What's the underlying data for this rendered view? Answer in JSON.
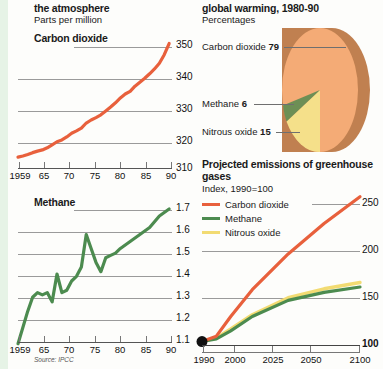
{
  "page": {
    "background": "#fdfdfb",
    "accent_strip_color": "#e6f3e6",
    "source_note": "Source: IPCC"
  },
  "left_column": {
    "heading": "the atmosphere",
    "subheading": "Parts per million",
    "co2_chart_title": "Carbon dioxide",
    "methane_chart_title": "Methane"
  },
  "right_column": {
    "heading": "global warming, 1980-90",
    "subheading": "Percentages",
    "projection_title_line1": "Projected emissions of greenhouse",
    "projection_title_line2": "gases",
    "projection_subtitle": "Index, 1990=100"
  },
  "colors": {
    "carbon_dioxide": "#e8603c",
    "methane": "#4c8b4f",
    "nitrous_oxide": "#f2db72",
    "pie_carbon_dioxide": "#f4ab76",
    "pie_carbon_dioxide_side": "#c08050",
    "pie_methane": "#6d8f55",
    "pie_nitrous_oxide": "#f5e08a",
    "gridline": "#9a9a9a"
  },
  "chart_data": [
    {
      "id": "co2-concentration",
      "type": "line",
      "title": "Carbon dioxide",
      "subtitle": "Parts per million",
      "xlabel": "",
      "ylabel": "",
      "ylim": [
        310,
        355
      ],
      "yticks": [
        310,
        320,
        330,
        340,
        350
      ],
      "ytick_labels": [
        "310",
        "320",
        "330",
        "340",
        "350"
      ],
      "xlim": [
        1959,
        1991
      ],
      "xticks": [
        1959,
        1965,
        1970,
        1975,
        1980,
        1985,
        1990
      ],
      "xtick_labels": [
        "1959",
        "65",
        "70",
        "75",
        "80",
        "85",
        "90"
      ],
      "grid": true,
      "series": [
        {
          "name": "Carbon dioxide",
          "color": "#e8603c",
          "x": [
            1959,
            1960,
            1961,
            1962,
            1963,
            1964,
            1965,
            1966,
            1967,
            1968,
            1969,
            1970,
            1971,
            1972,
            1973,
            1974,
            1975,
            1976,
            1977,
            1978,
            1979,
            1980,
            1981,
            1982,
            1983,
            1984,
            1985,
            1986,
            1987,
            1988,
            1989,
            1990
          ],
          "values": [
            315.9,
            316.3,
            316.8,
            317.4,
            317.9,
            318.3,
            319.0,
            320.0,
            321.0,
            321.6,
            322.6,
            323.8,
            324.6,
            325.5,
            327.2,
            328.2,
            329.0,
            329.9,
            331.2,
            332.5,
            333.9,
            335.5,
            336.8,
            337.7,
            339.4,
            340.7,
            342.0,
            343.5,
            345.1,
            347.0,
            349.8,
            353.5
          ]
        }
      ]
    },
    {
      "id": "methane-concentration",
      "type": "line",
      "title": "Methane",
      "subtitle": "Parts per million",
      "xlabel": "",
      "ylabel": "",
      "ylim": [
        1.1,
        1.72
      ],
      "yticks": [
        1.1,
        1.2,
        1.3,
        1.4,
        1.5,
        1.6,
        1.7
      ],
      "ytick_labels": [
        "1.1",
        "1.2",
        "1.3",
        "1.4",
        "1.5",
        "1.6",
        "1.7"
      ],
      "xlim": [
        1959,
        1991
      ],
      "xticks": [
        1959,
        1965,
        1970,
        1975,
        1980,
        1985,
        1990
      ],
      "xtick_labels": [
        "1959",
        "65",
        "70",
        "75",
        "80",
        "85",
        "90"
      ],
      "grid": true,
      "series": [
        {
          "name": "Methane",
          "color": "#4c8b4f",
          "x": [
            1959,
            1961,
            1962,
            1963,
            1964,
            1965,
            1966,
            1967,
            1968,
            1969,
            1970,
            1971,
            1972,
            1973,
            1974,
            1975,
            1976,
            1977,
            1978,
            1979,
            1980,
            1982,
            1984,
            1986,
            1988,
            1990
          ],
          "values": [
            1.11,
            1.25,
            1.31,
            1.33,
            1.32,
            1.33,
            1.29,
            1.41,
            1.33,
            1.34,
            1.38,
            1.4,
            1.44,
            1.58,
            1.52,
            1.46,
            1.42,
            1.48,
            1.49,
            1.5,
            1.52,
            1.55,
            1.58,
            1.61,
            1.66,
            1.69
          ]
        }
      ]
    },
    {
      "id": "global-warming-share",
      "type": "pie",
      "title": "global warming, 1980-90",
      "subtitle": "Percentages",
      "labels": [
        "Carbon dioxide",
        "Methane",
        "Nitrous oxide"
      ],
      "values": [
        79,
        6,
        15
      ],
      "colors": [
        "#f4ab76",
        "#6d8f55",
        "#f5e08a"
      ],
      "legend_position": "left-callouts"
    },
    {
      "id": "projected-emissions",
      "type": "line",
      "title": "Projected emissions of greenhouse gases",
      "subtitle": "Index, 1990=100",
      "xlabel": "",
      "ylabel": "",
      "ylim": [
        95,
        265
      ],
      "yticks": [
        100,
        150,
        200,
        250
      ],
      "ytick_labels": [
        "100",
        "150",
        "200",
        "250"
      ],
      "xlim": [
        1990,
        2100
      ],
      "xticks": [
        1990,
        2000,
        2025,
        2050,
        2075,
        2100
      ],
      "xtick_labels": [
        "1990",
        "2000",
        "2025",
        "2050",
        "",
        "2100"
      ],
      "grid": true,
      "legend_position": "top-left",
      "series": [
        {
          "name": "Carbon dioxide",
          "color": "#e8603c",
          "x": [
            1990,
            2000,
            2010,
            2025,
            2050,
            2075,
            2100
          ],
          "values": [
            100,
            106,
            128,
            158,
            198,
            232,
            262
          ]
        },
        {
          "name": "Methane",
          "color": "#4c8b4f",
          "x": [
            1990,
            2000,
            2010,
            2025,
            2050,
            2075,
            2100
          ],
          "values": [
            100,
            103,
            112,
            128,
            146,
            155,
            161
          ]
        },
        {
          "name": "Nitrous oxide",
          "color": "#f2db72",
          "x": [
            1990,
            2000,
            2010,
            2025,
            2050,
            2075,
            2100
          ],
          "values": [
            100,
            104,
            114,
            130,
            149,
            159,
            166
          ]
        }
      ],
      "origin_marker": true
    }
  ],
  "legend": {
    "items": [
      {
        "label": "Carbon dioxide",
        "color": "#e8603c"
      },
      {
        "label": "Methane",
        "color": "#4c8b4f"
      },
      {
        "label": "Nitrous oxide",
        "color": "#f2db72"
      }
    ]
  },
  "pie_callouts": [
    {
      "name": "Carbon dioxide",
      "value": "79"
    },
    {
      "name": "Methane",
      "value": "6"
    },
    {
      "name": "Nitrous oxide",
      "value": "15"
    }
  ],
  "co2_y_labels": [
    "350",
    "340",
    "330",
    "320",
    "310"
  ],
  "methane_y_labels": [
    "1.7",
    "1.6",
    "1.5",
    "1.4",
    "1.3",
    "1.2",
    "1.1"
  ],
  "shared_x_labels": [
    "1959",
    "65",
    "70",
    "75",
    "80",
    "85",
    "90"
  ],
  "proj_y_labels": [
    "250",
    "200",
    "150",
    "100"
  ],
  "proj_x_labels": [
    "1990",
    "2000",
    "2025",
    "2050",
    "2100"
  ]
}
